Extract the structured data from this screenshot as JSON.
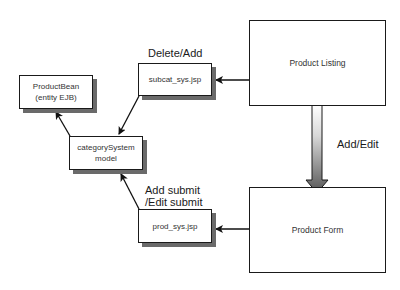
{
  "diagram": {
    "type": "flow",
    "nodes": [
      {
        "id": "product-bean",
        "label": "ProductBean\n(entity EJB)"
      },
      {
        "id": "category-system-model",
        "label": "categorySystem\nmodel"
      },
      {
        "id": "subcat-sys-jsp",
        "label": "subcat_sys.jsp"
      },
      {
        "id": "prod-sys-jsp",
        "label": "prod_sys.jsp"
      },
      {
        "id": "product-listing",
        "label": "Product Listing"
      },
      {
        "id": "product-form",
        "label": "Product Form"
      }
    ],
    "edges": [
      {
        "from": "product-listing",
        "to": "subcat-sys-jsp",
        "label": ""
      },
      {
        "from": "subcat-sys-jsp",
        "to": "category-system-model",
        "label": "Delete/Add"
      },
      {
        "from": "category-system-model",
        "to": "product-bean",
        "label": ""
      },
      {
        "from": "product-listing",
        "to": "product-form",
        "label": "Add/Edit"
      },
      {
        "from": "product-form",
        "to": "prod-sys-jsp",
        "label": ""
      },
      {
        "from": "prod-sys-jsp",
        "to": "category-system-model",
        "label": "Add submit\n/Edit submit"
      }
    ],
    "edge_labels": {
      "delete_add": "Delete/Add",
      "add_edit": "Add/Edit",
      "add_submit_edit_submit": "Add submit\n/Edit submit"
    }
  }
}
